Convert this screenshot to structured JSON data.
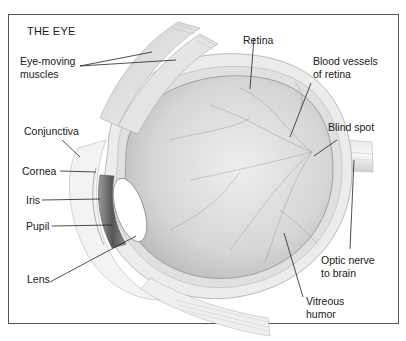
{
  "title": "THE EYE",
  "labels": {
    "eye_moving_muscles": "Eye-moving\nmuscles",
    "conjunctiva": "Conjunctiva",
    "cornea": "Cornea",
    "iris": "Iris",
    "pupil": "Pupil",
    "lens": "Lens",
    "retina": "Retina",
    "blood_vessels": "Blood vessels\nof retina",
    "blind_spot": "Blind spot",
    "optic_nerve": "Optic nerve\nto brain",
    "vitreous_humor": "Vitreous\nhumor"
  },
  "colors": {
    "frame": "#555555",
    "leader": "#222222",
    "sclera": "#e6e6e6",
    "vitreous": "#d4d4d4",
    "iris": "#6a6a6a",
    "lens": "#ffffff"
  }
}
